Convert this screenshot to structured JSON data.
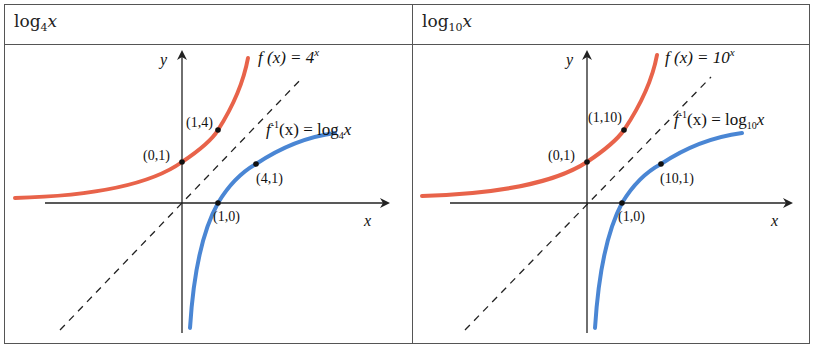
{
  "table": {
    "columns": [
      {
        "header_base": "log",
        "header_sub": "4",
        "header_var": "x"
      },
      {
        "header_base": "log",
        "header_sub": "10",
        "header_var": "x"
      }
    ]
  },
  "panels": [
    {
      "axis_x_label": "x",
      "axis_y_label": "y",
      "exp_label": "f (x) = 4",
      "exp_sup": "x",
      "log_label_pre": "f",
      "log_label_sup": "-1",
      "log_label_mid": "(x) = log",
      "log_label_sub": "4",
      "log_label_var": "x",
      "points": [
        {
          "label": "(0,1)"
        },
        {
          "label": "(1,4)"
        },
        {
          "label": "(4,1)"
        },
        {
          "label": "(1,0)"
        }
      ]
    },
    {
      "axis_x_label": "x",
      "axis_y_label": "y",
      "exp_label": "f (x) = 10",
      "exp_sup": "x",
      "log_label_pre": "f",
      "log_label_sup": "-1",
      "log_label_mid": "(x) = log",
      "log_label_sub": "10",
      "log_label_var": "x",
      "points": [
        {
          "label": "(0,1)"
        },
        {
          "label": "(1,10)"
        },
        {
          "label": "(10,1)"
        },
        {
          "label": "(1,0)"
        }
      ]
    }
  ],
  "colors": {
    "exponential_curve": "#e8634a",
    "log_curve": "#4a86d4",
    "axes": "#222222",
    "identity_line": "#222222",
    "border": "#555555"
  }
}
